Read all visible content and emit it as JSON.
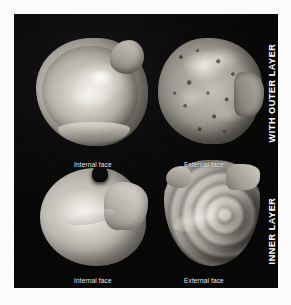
{
  "figure": {
    "caption_top_left": "Internal face",
    "caption_top_right": "External face",
    "caption_bottom_left": "Internal face",
    "caption_bottom_right": "External face",
    "group_label_top": "WITH OUTER LAYER",
    "group_label_bottom": "INNER LAYER",
    "colors": {
      "plate_background": "#080808",
      "page_background": "#fbfbfb",
      "caption_text": "#efefed",
      "group_label_text": "#ffffff",
      "shell_light": "#e6e3dc",
      "shell_mid": "#b9b4aa",
      "shell_dark": "#7a756e"
    },
    "specimens": [
      {
        "position": "top-left",
        "face": "Internal face",
        "layer": "WITH OUTER LAYER",
        "description": "rounded bivalve valve, nacreous pale interior with raised rim and umbo notch"
      },
      {
        "position": "top-right",
        "face": "External face",
        "layer": "WITH OUTER LAYER",
        "description": "rough encrusted exterior, mottled and pitted with dark speckles"
      },
      {
        "position": "bottom-left",
        "face": "Internal face",
        "layer": "INNER LAYER",
        "description": "smooth pale interior with beak notch and angular posterior wing"
      },
      {
        "position": "bottom-right",
        "face": "External face",
        "layer": "INNER LAYER",
        "description": "teardrop valve showing concentric growth rings from the umbo"
      }
    ]
  }
}
